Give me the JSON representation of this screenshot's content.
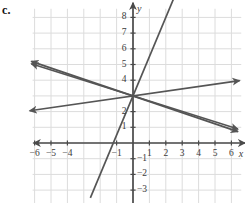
{
  "problem": {
    "label": "c."
  },
  "chart_data": {
    "type": "line",
    "title": "",
    "xlabel": "x",
    "ylabel": "y",
    "xlim": [
      -6.6,
      6.6
    ],
    "ylim": [
      -3.6,
      8.6
    ],
    "grid": true,
    "legend": "none",
    "x_ticks": [
      -6,
      -5,
      -4,
      -1,
      1,
      2,
      3,
      4,
      5,
      6
    ],
    "x_tick_labels": [
      "−6",
      "−5",
      "−4",
      "−1",
      "1",
      "2",
      "3",
      "4",
      "5",
      "6"
    ],
    "y_ticks": [
      8,
      7,
      6,
      5,
      4,
      2,
      1,
      -1,
      -2,
      -3
    ],
    "y_tick_labels": [
      "8",
      "7",
      "6",
      "5",
      "4",
      "2",
      "1",
      "−1",
      "−2",
      "−3"
    ],
    "common_intercept": [
      0,
      3
    ],
    "series": [
      {
        "name": "steep-rising-line",
        "slope": 2.5,
        "intercept": 3,
        "x_start": -2.6,
        "x_end": 4.4,
        "arrow_start": false,
        "arrow_end": true
      },
      {
        "name": "shallow-rising-line",
        "slope": 0.15,
        "intercept": 3,
        "x_start": -6.3,
        "x_end": 6.5,
        "arrow_start": true,
        "arrow_end": true
      },
      {
        "name": "steep-falling-line",
        "slope": -0.355,
        "intercept": 3,
        "x_start": -6.2,
        "x_end": 6.4,
        "arrow_start": true,
        "arrow_end": true
      },
      {
        "name": "shallow-falling-line",
        "slope": -0.33,
        "intercept": 3,
        "x_start": -6.2,
        "x_end": 6.4,
        "arrow_start": true,
        "arrow_end": true
      }
    ]
  },
  "colors": {
    "line": "#555555",
    "axis": "#4a4a4a",
    "grid": "#dcdcdc",
    "background": "#ffffff",
    "text": "#3a3a3a"
  }
}
